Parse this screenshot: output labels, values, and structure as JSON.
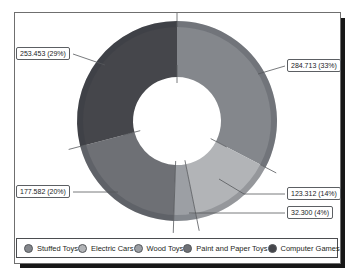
{
  "figure": {
    "background": "#ffffff",
    "frame_border": "#6f6f6f",
    "shadow_color": "#171717",
    "line_color": "#55585c"
  },
  "chart_data": {
    "type": "pie",
    "subtype": "donut",
    "title": "",
    "legend_position": "bottom",
    "direction": "clockwise",
    "start_angle": 0,
    "inner_radius_ratio": 0.44,
    "slices": [
      {
        "category": "Stuffed Toys",
        "value": 284713,
        "value_display": "284.713",
        "percent": 33,
        "callout": "284.713 (33%)",
        "color": "#84878C"
      },
      {
        "category": "Electric Cars",
        "value": 123312,
        "value_display": "123.312",
        "percent": 14,
        "callout": "123.312 (14%)",
        "color": "#B2B4B7"
      },
      {
        "category": "Wood Toys",
        "value": 32300,
        "value_display": "32.300",
        "percent": 4,
        "callout": "32.300 (4%)",
        "color": "#9C9FA4"
      },
      {
        "category": "Paint and Paper Toys",
        "value": 177582,
        "value_display": "177.582",
        "percent": 20,
        "callout": "177.582 (20%)",
        "color": "#6E7075"
      },
      {
        "category": "Computer Games",
        "value": 253453,
        "value_display": "253.453",
        "percent": 29,
        "callout": "253.453 (29%)",
        "color": "#45464B"
      }
    ],
    "legend_items": [
      "Stuffed Toys",
      "Electric Cars",
      "Wood Toys",
      "Paint and Paper Toys",
      "Computer Games"
    ]
  }
}
